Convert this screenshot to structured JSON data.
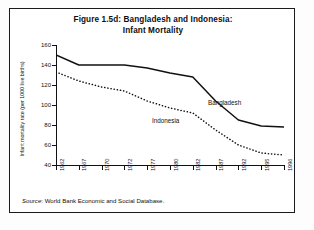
{
  "figure": {
    "title_line1": "Figure 1.5d: Bangladesh and Indonesia:",
    "title_line2": "Infant Mortality",
    "source_prefix": "Source",
    "source_text": ": World Bank Economic and Social Database."
  },
  "chart_data": {
    "type": "line",
    "title": "Figure 1.5d: Bangladesh and Indonesia: Infant Mortality",
    "xlabel": "",
    "ylabel": "Infant mortality rate (per 1000 live births)",
    "categories": [
      "1962",
      "1967",
      "1970",
      "1972",
      "1977",
      "1980",
      "1982",
      "1987",
      "1992",
      "1995",
      "1996"
    ],
    "ylim": [
      40,
      160
    ],
    "yticks": [
      40,
      60,
      80,
      100,
      120,
      140,
      160
    ],
    "grid": false,
    "legend_position": "inline-annotations",
    "series": [
      {
        "name": "Bangladesh",
        "style": "solid",
        "color": "#111111",
        "values": [
          150,
          140,
          140,
          140,
          137,
          132,
          128,
          104,
          85,
          79,
          78
        ]
      },
      {
        "name": "Indonesia",
        "style": "dotted",
        "color": "#111111",
        "values": [
          133,
          124,
          118,
          114,
          104,
          97,
          92,
          75,
          60,
          52,
          50
        ]
      }
    ],
    "annotations": [
      {
        "text": "Bangladesh",
        "series": "Bangladesh"
      },
      {
        "text": "Indonesia",
        "series": "Indonesia"
      }
    ]
  }
}
